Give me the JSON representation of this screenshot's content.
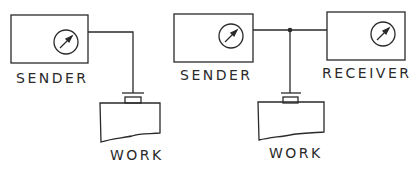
{
  "diagram": {
    "left": {
      "sender_label": "SENDER",
      "work_label": "WORK"
    },
    "right": {
      "sender_label": "SENDER",
      "receiver_label": "RECEIVER",
      "work_label": "WORK"
    },
    "colors": {
      "stroke": "#2a2a2a",
      "background": "#ffffff"
    }
  }
}
